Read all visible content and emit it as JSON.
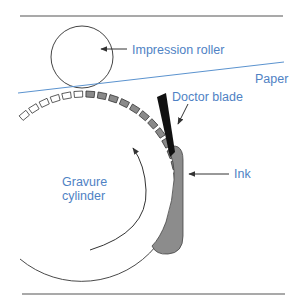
{
  "diagram": {
    "colors": {
      "label": "#4f82c4",
      "paper_line": "#5b93cf",
      "outline": "#4a4a4a",
      "cell_filled": "#8a8a8a",
      "cell_empty": "#ffffff",
      "ink": "#8c8c8c",
      "blade": "#111111",
      "rule": "#555555"
    },
    "labels": {
      "impression_roller": "Impression roller",
      "paper": "Paper",
      "doctor_blade": "Doctor blade",
      "ink": "Ink",
      "gravure_cylinder_line1": "Gravure",
      "gravure_cylinder_line2": "cylinder"
    },
    "components": [
      {
        "id": "impression-roller",
        "shape": "circle"
      },
      {
        "id": "paper",
        "shape": "line"
      },
      {
        "id": "gravure-cylinder",
        "shape": "arc",
        "rotation": "clockwise"
      },
      {
        "id": "engraved-cells",
        "empty_side": "before nip",
        "filled_side": "after nip"
      },
      {
        "id": "doctor-blade",
        "shape": "tapered bar"
      },
      {
        "id": "ink-reservoir",
        "shape": "rounded trough"
      }
    ]
  }
}
